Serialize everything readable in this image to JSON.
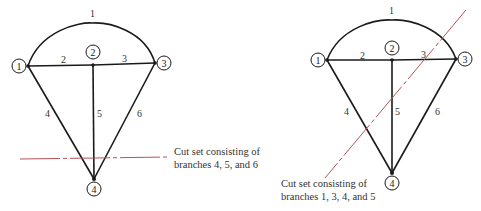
{
  "diagrams": [
    {
      "id": "left",
      "nodes": [
        {
          "label": "1",
          "junction": [
            28,
            66
          ],
          "circle": [
            19,
            66
          ]
        },
        {
          "label": "2",
          "junction": [
            93,
            65
          ],
          "circle": [
            93,
            52
          ]
        },
        {
          "label": "3",
          "junction": [
            155,
            63
          ],
          "circle": [
            164,
            63
          ]
        },
        {
          "label": "4",
          "junction": [
            94,
            179
          ],
          "circle": [
            94,
            189
          ]
        }
      ],
      "branches": [
        {
          "label": "1",
          "label_pos": [
            90,
            15
          ]
        },
        {
          "label": "2",
          "label_pos": [
            63,
            61
          ]
        },
        {
          "label": "3",
          "label_pos": [
            124,
            61
          ]
        },
        {
          "label": "4",
          "label_pos": [
            47,
            115
          ]
        },
        {
          "label": "5",
          "label_pos": [
            98,
            115
          ]
        },
        {
          "label": "6",
          "label_pos": [
            138,
            115
          ]
        }
      ],
      "cut_line": {
        "from": [
          20,
          159
        ],
        "to": [
          169,
          157
        ],
        "color": "#b5535a"
      },
      "caption": {
        "line1": "Cut set consisting of",
        "line2": "branches 4, 5, and 6"
      }
    },
    {
      "id": "right",
      "nodes": [
        {
          "label": "1",
          "junction": [
            327,
            60
          ],
          "circle": [
            318,
            60
          ]
        },
        {
          "label": "2",
          "junction": [
            392,
            60
          ],
          "circle": [
            392,
            48
          ]
        },
        {
          "label": "3",
          "junction": [
            456,
            59
          ],
          "circle": [
            465,
            59
          ]
        },
        {
          "label": "4",
          "junction": [
            392,
            173
          ],
          "circle": [
            392,
            183
          ]
        }
      ],
      "branches": [
        {
          "label": "1",
          "label_pos": [
            390,
            12
          ]
        },
        {
          "label": "2",
          "label_pos": [
            361,
            57
          ]
        },
        {
          "label": "3",
          "label_pos": [
            422,
            57
          ]
        },
        {
          "label": "4",
          "label_pos": [
            345,
            113
          ]
        },
        {
          "label": "5",
          "label_pos": [
            396,
            113
          ]
        },
        {
          "label": "6",
          "label_pos": [
            436,
            113
          ]
        }
      ],
      "cut_line": {
        "from": [
          466,
          10
        ],
        "to": [
          325,
          178
        ],
        "color": "#b5535a"
      },
      "caption": {
        "line1": "Cut set consisting of",
        "line2": "branches 1, 3, 4, and 5"
      }
    }
  ]
}
